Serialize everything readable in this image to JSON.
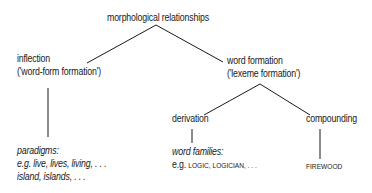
{
  "diagram": {
    "root": {
      "label": "morphological relationships"
    },
    "inflection": {
      "line1": "inflection",
      "line2": "('word-form formation')"
    },
    "word_formation": {
      "line1": "word formation",
      "line2": "('lexeme formation')"
    },
    "derivation": {
      "label": "derivation"
    },
    "compounding": {
      "label": "compounding"
    },
    "paradigms": {
      "heading": "paradigms:",
      "line1_prefix": "e.g. ",
      "line1": "live, lives, living, . . .",
      "line2": "island, islands, . . ."
    },
    "word_families": {
      "heading": "word families:",
      "prefix": "e.g. ",
      "examples": "LOGIC, LOGICIAN, . . ."
    },
    "compound_example": {
      "label": "FIREWOOD"
    },
    "line_color": "#1a1a1a"
  }
}
